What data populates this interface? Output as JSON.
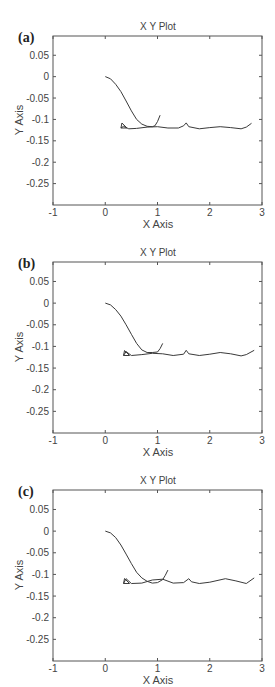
{
  "chart_data": [
    {
      "type": "line",
      "panel_label": "(a)",
      "title": "X Y Plot",
      "xlabel": "X Axis",
      "ylabel": "Y Axis",
      "xlim": [
        -1,
        3
      ],
      "ylim": [
        -0.3,
        0.095
      ],
      "xticks": [
        "-1",
        "0",
        "1",
        "2",
        "3"
      ],
      "yticks": [
        "0.05",
        "0",
        "-0.05",
        "-0.1",
        "-0.15",
        "-0.2",
        "-0.25"
      ],
      "grid": false,
      "series": [
        {
          "name": "trajectory-1",
          "x": [
            0,
            0.1,
            0.2,
            0.3,
            0.4,
            0.5,
            0.6,
            0.7,
            0.8,
            0.9,
            0.95,
            1.0,
            1.05
          ],
          "y": [
            0,
            -0.005,
            -0.018,
            -0.035,
            -0.057,
            -0.08,
            -0.1,
            -0.111,
            -0.116,
            -0.117,
            -0.115,
            -0.105,
            -0.09
          ]
        },
        {
          "name": "trajectory-2",
          "x": [
            0.3,
            0.35,
            0.45,
            0.6,
            0.8,
            1.0,
            1.2,
            1.4,
            1.5,
            1.55,
            1.6,
            1.8,
            2.0,
            2.2,
            2.4,
            2.6,
            2.7,
            2.8
          ],
          "y": [
            -0.12,
            -0.116,
            -0.122,
            -0.121,
            -0.118,
            -0.117,
            -0.12,
            -0.12,
            -0.115,
            -0.108,
            -0.117,
            -0.122,
            -0.119,
            -0.117,
            -0.119,
            -0.122,
            -0.118,
            -0.109
          ]
        }
      ]
    },
    {
      "type": "line",
      "panel_label": "(b)",
      "title": "X Y Plot",
      "xlabel": "X Axis",
      "ylabel": "Y Axis",
      "xlim": [
        -1,
        3
      ],
      "ylim": [
        -0.3,
        0.095
      ],
      "xticks": [
        "-1",
        "0",
        "1",
        "2",
        "3"
      ],
      "yticks": [
        "0.05",
        "0",
        "-0.05",
        "-0.1",
        "-0.15",
        "-0.2",
        "-0.25"
      ],
      "grid": false,
      "series": [
        {
          "name": "trajectory-1",
          "x": [
            0,
            0.1,
            0.2,
            0.3,
            0.4,
            0.5,
            0.6,
            0.7,
            0.8,
            0.9,
            1.0,
            1.05,
            1.1
          ],
          "y": [
            0,
            -0.004,
            -0.015,
            -0.03,
            -0.05,
            -0.072,
            -0.093,
            -0.108,
            -0.114,
            -0.114,
            -0.113,
            -0.105,
            -0.093
          ]
        },
        {
          "name": "trajectory-2",
          "x": [
            0.35,
            0.4,
            0.5,
            0.7,
            0.9,
            1.1,
            1.3,
            1.5,
            1.55,
            1.6,
            1.8,
            2.0,
            2.2,
            2.4,
            2.6,
            2.7,
            2.85
          ],
          "y": [
            -0.121,
            -0.112,
            -0.121,
            -0.119,
            -0.116,
            -0.117,
            -0.121,
            -0.118,
            -0.109,
            -0.117,
            -0.121,
            -0.118,
            -0.114,
            -0.117,
            -0.122,
            -0.119,
            -0.109
          ]
        }
      ]
    },
    {
      "type": "line",
      "panel_label": "(c)",
      "title": "X Y Plot",
      "xlabel": "X Axis",
      "ylabel": "Y Axis",
      "xlim": [
        -1,
        3
      ],
      "ylim": [
        -0.3,
        0.095
      ],
      "xticks": [
        "-1",
        "0",
        "1",
        "2",
        "3"
      ],
      "yticks": [
        "0.05",
        "0",
        "-0.05",
        "-0.1",
        "-0.15",
        "-0.2",
        "-0.25"
      ],
      "grid": false,
      "series": [
        {
          "name": "trajectory-1",
          "x": [
            0,
            0.1,
            0.2,
            0.3,
            0.4,
            0.5,
            0.6,
            0.7,
            0.8,
            0.9,
            1.0,
            1.1,
            1.15,
            1.2
          ],
          "y": [
            0,
            -0.004,
            -0.015,
            -0.032,
            -0.053,
            -0.075,
            -0.095,
            -0.108,
            -0.116,
            -0.12,
            -0.119,
            -0.112,
            -0.102,
            -0.09
          ]
        },
        {
          "name": "trajectory-2",
          "x": [
            0.35,
            0.4,
            0.5,
            0.7,
            0.9,
            1.1,
            1.3,
            1.5,
            1.6,
            1.65,
            1.8,
            2.0,
            2.3,
            2.5,
            2.7,
            2.85
          ],
          "y": [
            -0.121,
            -0.11,
            -0.121,
            -0.12,
            -0.113,
            -0.111,
            -0.12,
            -0.119,
            -0.11,
            -0.117,
            -0.121,
            -0.118,
            -0.11,
            -0.115,
            -0.121,
            -0.108
          ]
        }
      ]
    }
  ]
}
